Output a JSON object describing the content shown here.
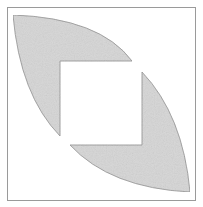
{
  "diagram": {
    "colors": {
      "background": "#ffffff",
      "frame": "#9a9a9a",
      "fill": "#d6d6d6",
      "shape_stroke": "#8c8c8c"
    },
    "frame": {
      "x": 7,
      "y": 7,
      "width": 188,
      "height": 193
    },
    "inner_square": {
      "x": 60,
      "y": 61,
      "width": 82,
      "height": 84
    },
    "shapes": [
      {
        "name": "upper-left-region",
        "corner": [
          13,
          15
        ],
        "tip_right": [
          132,
          61
        ],
        "tip_bottom": [
          60,
          136
        ]
      },
      {
        "name": "lower-right-region",
        "corner": [
          190,
          192
        ],
        "tip_top": [
          142,
          72
        ],
        "tip_left": [
          70,
          145
        ]
      }
    ]
  }
}
